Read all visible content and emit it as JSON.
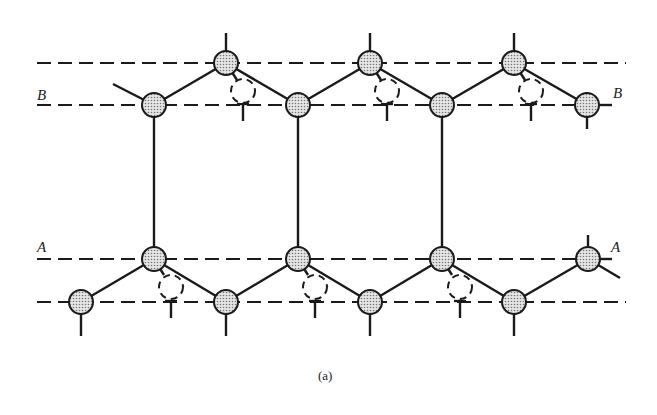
{
  "figure": {
    "caption": "(a)",
    "plane_labels": {
      "B_left": "B",
      "B_right": "B",
      "A_left": "A",
      "A_right": "A"
    }
  },
  "colors": {
    "line": "#1a1a1a",
    "atom_fill": "#cfcfcf",
    "background": "#ffffff"
  },
  "dashed_lines_y": [
    63,
    105,
    259,
    302
  ],
  "atoms": {
    "top_row": [
      [
        226,
        63
      ],
      [
        370,
        63
      ],
      [
        514,
        63
      ]
    ],
    "plane_B": [
      [
        154,
        105
      ],
      [
        298,
        105
      ],
      [
        442,
        105
      ],
      [
        587,
        105
      ]
    ],
    "plane_A": [
      [
        154,
        259
      ],
      [
        298,
        259
      ],
      [
        442,
        259
      ],
      [
        588,
        259
      ]
    ],
    "bottom_row": [
      [
        81,
        302
      ],
      [
        226,
        302
      ],
      [
        370,
        302
      ],
      [
        514,
        302
      ]
    ]
  },
  "dangling_atoms": {
    "upper": [
      [
        243,
        91
      ],
      [
        387,
        91
      ],
      [
        531,
        91
      ]
    ],
    "lower": [
      [
        171,
        287
      ],
      [
        315,
        287
      ],
      [
        460,
        287
      ]
    ]
  }
}
